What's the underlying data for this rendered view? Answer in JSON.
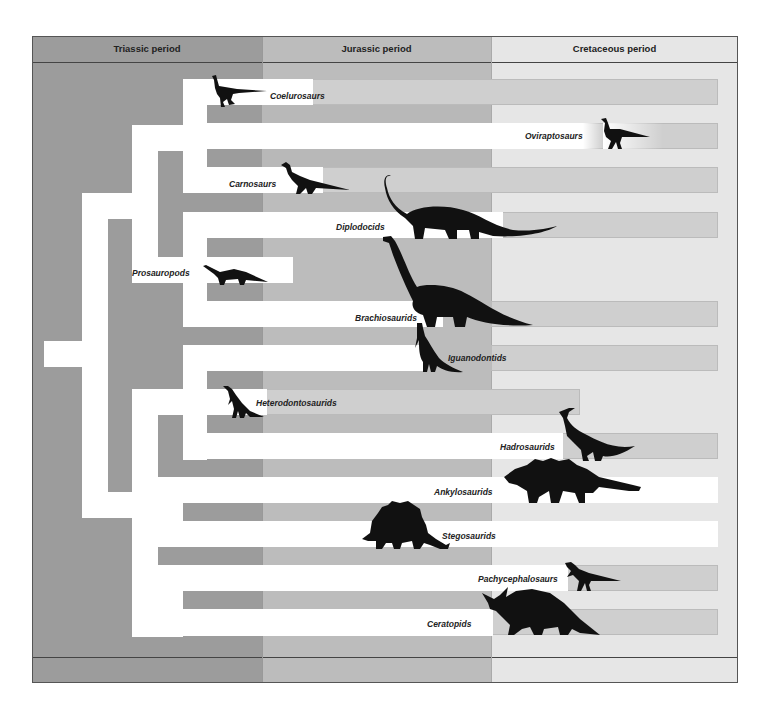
{
  "periods": [
    {
      "id": "triassic",
      "label": "Triassic period",
      "color": "#9c9c9c"
    },
    {
      "id": "jurassic",
      "label": "Jurassic period",
      "color": "#bcbcbc"
    },
    {
      "id": "cretaceous",
      "label": "Cretaceous period",
      "color": "#e6e6e6"
    }
  ],
  "groups": [
    {
      "id": "coelurosaurs",
      "label": "Coelurosaurs",
      "icon": "coelurosaur-silhouette-icon"
    },
    {
      "id": "oviraptosaurs",
      "label": "Oviraptosaurs",
      "icon": "oviraptosaur-silhouette-icon"
    },
    {
      "id": "carnosaurs",
      "label": "Carnosaurs",
      "icon": "carnosaur-silhouette-icon"
    },
    {
      "id": "diplodocids",
      "label": "Diplodocids",
      "icon": "diplodocid-silhouette-icon"
    },
    {
      "id": "prosauropods",
      "label": "Prosauropods",
      "icon": "prosauropod-silhouette-icon"
    },
    {
      "id": "brachiosaurids",
      "label": "Brachiosaurids",
      "icon": "brachiosaurid-silhouette-icon"
    },
    {
      "id": "iguanodontids",
      "label": "Iguanodontids",
      "icon": "iguanodontid-silhouette-icon"
    },
    {
      "id": "heterodontosaurids",
      "label": "Heterodontosaurids",
      "icon": "heterodontosaurid-silhouette-icon"
    },
    {
      "id": "hadrosaurids",
      "label": "Hadrosaurids",
      "icon": "hadrosaurid-silhouette-icon"
    },
    {
      "id": "ankylosaurids",
      "label": "Ankylosaurids",
      "icon": "ankylosaurid-silhouette-icon"
    },
    {
      "id": "stegosaurids",
      "label": "Stegosaurids",
      "icon": "stegosaurid-silhouette-icon"
    },
    {
      "id": "pachycephalosaurs",
      "label": "Pachycephalosaurs",
      "icon": "pachycephalosaur-silhouette-icon"
    },
    {
      "id": "ceratopids",
      "label": "Ceratopids",
      "icon": "ceratopid-silhouette-icon"
    }
  ]
}
